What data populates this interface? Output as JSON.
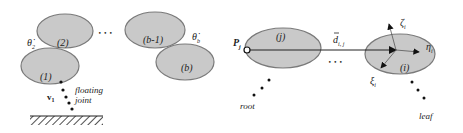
{
  "left_panel": {
    "links": [
      {
        "id": "link-1",
        "label": "(1)",
        "cx": 47,
        "cy": 62,
        "rx": 29,
        "ry": 19
      },
      {
        "id": "link-2",
        "label": "(2)",
        "cx": 64,
        "cy": 31,
        "rx": 28,
        "ry": 19
      },
      {
        "id": "link-b-1",
        "label": "(b-1)",
        "cx": 154,
        "cy": 30,
        "rx": 28,
        "ry": 19
      },
      {
        "id": "link-b",
        "label": "(b)",
        "cx": 185,
        "cy": 61,
        "rx": 29,
        "ry": 19
      }
    ],
    "ellipsis": "• • •",
    "theta_2_label": "θ̇",
    "theta_2_sub": "2",
    "theta_b_label": "θ̇",
    "theta_b_sub": "b",
    "v1_label": "v",
    "v1_sub": "1",
    "floating_label_line1": "floating",
    "floating_label_line2": "joint"
  },
  "right_panel": {
    "link_j": {
      "label": "(j)",
      "cx": 283,
      "cy": 48,
      "rx": 37,
      "ry": 20
    },
    "link_i": {
      "label": "(i)",
      "cx": 404,
      "cy": 54,
      "rx": 35,
      "ry": 20
    },
    "p_label": "P",
    "p_sub": "j",
    "d_label": "d",
    "d_sub": "i, j",
    "ellipsis": "• • •",
    "zeta_label": "ζ",
    "zeta_sub": "i",
    "eta_label": "η",
    "eta_sub": "i",
    "xi_label": "ξ",
    "xi_sub": "i",
    "root_label": "root",
    "leaf_label": "leaf"
  }
}
